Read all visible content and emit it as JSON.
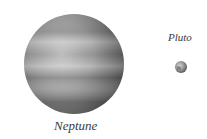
{
  "diagram": {
    "bodies": [
      {
        "name": "Neptune",
        "label": "Neptune",
        "cx": 74,
        "cy": 64,
        "r": 50,
        "color": "#8a8a8a"
      },
      {
        "name": "Pluto",
        "label": "Pluto",
        "cx": 181,
        "cy": 67,
        "r": 6,
        "color": "#7a7a7a"
      }
    ]
  }
}
